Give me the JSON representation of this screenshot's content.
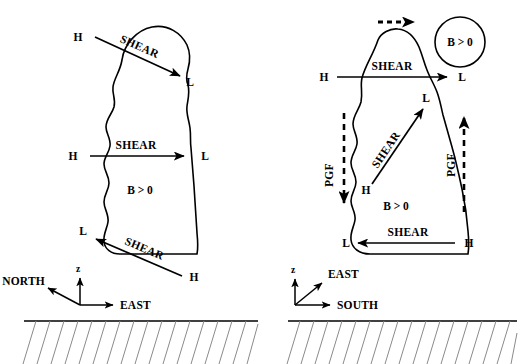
{
  "figure": {
    "background": "#ffffff",
    "line_color": "#000000",
    "hatch_color": "#8a8a8a"
  },
  "panels": [
    {
      "id": "left-panel",
      "name": "north-south-shear-panel",
      "buoyancy_label": "B > 0",
      "shear_arrows": [
        {
          "name": "upper-diagonal-shear",
          "label": "SHEAR",
          "high_label": "H",
          "low_label": "L",
          "direction": "down-right",
          "style": "solid"
        },
        {
          "name": "mid-horizontal-shear",
          "label": "SHEAR",
          "high_label": "H",
          "low_label": "L",
          "direction": "right",
          "style": "solid"
        },
        {
          "name": "lower-diagonal-shear",
          "label": "SHEAR",
          "high_label": "H",
          "low_label": "L",
          "direction": "up-left",
          "style": "solid"
        }
      ],
      "axes": {
        "name": "left-axes",
        "vertical_label": "z",
        "diagonal_label": "NORTH",
        "horizontal_label": "EAST"
      }
    },
    {
      "id": "right-panel",
      "name": "east-west-shear-panel",
      "buoyancy_label": "B > 0",
      "bubble_label": "B > 0",
      "motion_arrow": {
        "name": "storm-motion-arrow",
        "style": "dashed",
        "direction": "right"
      },
      "shear_arrows": [
        {
          "name": "upper-horizontal-shear",
          "label": "SHEAR",
          "high_label": "H",
          "low_label": "L",
          "direction": "right",
          "style": "solid"
        },
        {
          "name": "mid-diagonal-shear",
          "label": "SHEAR",
          "high_label": "H",
          "low_label": "L",
          "direction": "up-right",
          "style": "solid"
        },
        {
          "name": "lower-horizontal-shear",
          "label": "SHEAR",
          "high_label": "H",
          "low_label": "L",
          "direction": "left",
          "style": "solid"
        }
      ],
      "pgf_arrows": [
        {
          "name": "left-pgf-arrow",
          "label": "PGF",
          "direction": "down",
          "style": "dashed"
        },
        {
          "name": "right-pgf-arrow",
          "label": "PGF",
          "direction": "up",
          "style": "dashed"
        }
      ],
      "axes": {
        "name": "right-axes",
        "vertical_label": "z",
        "diagonal_label": "EAST",
        "horizontal_label": "SOUTH"
      }
    }
  ]
}
